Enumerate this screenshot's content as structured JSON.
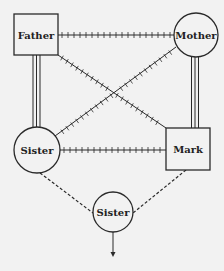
{
  "diagram": {
    "type": "genogram",
    "nodes": [
      {
        "id": "father",
        "label": "Father",
        "shape": "square",
        "cx": 36,
        "cy": 35
      },
      {
        "id": "mother",
        "label": "Mother",
        "shape": "circle",
        "cx": 196,
        "cy": 35
      },
      {
        "id": "sister_left",
        "label": "Sister",
        "shape": "circle",
        "cx": 37,
        "cy": 150
      },
      {
        "id": "mark",
        "label": "Mark",
        "shape": "square",
        "cx": 188,
        "cy": 149
      },
      {
        "id": "sister_bottom",
        "label": "Sister",
        "shape": "circle",
        "cx": 113,
        "cy": 212
      }
    ],
    "edges": [
      {
        "from": "father",
        "to": "mother",
        "style": "hatched"
      },
      {
        "from": "father",
        "to": "mark",
        "style": "hatched"
      },
      {
        "from": "mother",
        "to": "sister_left",
        "style": "hatched"
      },
      {
        "from": "sister_left",
        "to": "mark",
        "style": "hatched"
      },
      {
        "from": "father",
        "to": "sister_left",
        "style": "triple-line"
      },
      {
        "from": "mother",
        "to": "mark",
        "style": "triple-line"
      },
      {
        "from": "sister_left",
        "to": "sister_bottom",
        "style": "dashed"
      },
      {
        "from": "mark",
        "to": "sister_bottom",
        "style": "dashed"
      },
      {
        "from": "sister_bottom",
        "to": "below",
        "style": "arrow"
      }
    ],
    "colors": {
      "line": "#2a2a2a",
      "background": "#f2f2f2",
      "node_fill": "#f2f2f2"
    }
  }
}
